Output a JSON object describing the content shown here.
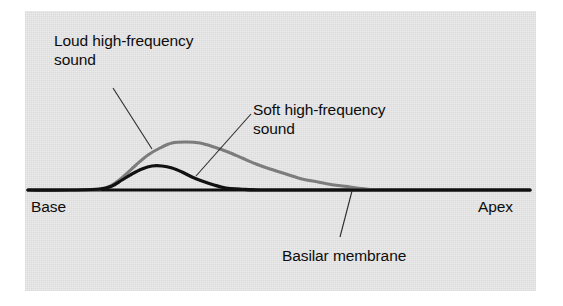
{
  "figure": {
    "kind": "scientific-diagram",
    "background_color": "#ffffff",
    "panel_color": "#e9e9e9"
  },
  "labels": {
    "loud": "Loud high-frequency\nsound",
    "soft": "Soft high-frequency\nsound",
    "basilar": "Basilar membrane",
    "base": "Base",
    "apex": "Apex"
  },
  "chart_data": {
    "type": "line",
    "title": "",
    "xlabel": "",
    "ylabel": "",
    "grid": false,
    "legend": "none",
    "axis_endpoints": {
      "left": "Base",
      "right": "Apex"
    },
    "xlim": [
      28,
      530
    ],
    "ylim": [
      190,
      138
    ],
    "series": [
      {
        "name": "Loud high-frequency sound",
        "color": "#7c7c7c",
        "width": 3.0,
        "peak": {
          "x": 176,
          "y": 142
        },
        "points": [
          [
            28,
            190
          ],
          [
            70,
            190
          ],
          [
            100,
            189
          ],
          [
            112,
            185
          ],
          [
            124,
            176
          ],
          [
            136,
            165
          ],
          [
            148,
            155
          ],
          [
            160,
            148
          ],
          [
            172,
            143
          ],
          [
            186,
            142
          ],
          [
            200,
            143
          ],
          [
            214,
            147
          ],
          [
            228,
            152
          ],
          [
            242,
            158
          ],
          [
            256,
            164
          ],
          [
            270,
            169
          ],
          [
            286,
            174
          ],
          [
            302,
            179
          ],
          [
            318,
            182
          ],
          [
            334,
            185
          ],
          [
            350,
            187
          ],
          [
            366,
            189
          ],
          [
            378,
            190
          ]
        ]
      },
      {
        "name": "Soft high-frequency sound",
        "color": "#111111",
        "width": 3.2,
        "peak": {
          "x": 156,
          "y": 166
        },
        "points": [
          [
            28,
            190
          ],
          [
            70,
            190
          ],
          [
            100,
            189
          ],
          [
            112,
            186
          ],
          [
            122,
            180
          ],
          [
            132,
            174
          ],
          [
            142,
            169
          ],
          [
            152,
            166
          ],
          [
            162,
            166
          ],
          [
            172,
            168
          ],
          [
            182,
            172
          ],
          [
            192,
            177
          ],
          [
            202,
            181
          ],
          [
            214,
            185
          ],
          [
            226,
            188
          ],
          [
            240,
            189
          ],
          [
            260,
            190
          ],
          [
            320,
            190
          ],
          [
            420,
            190
          ],
          [
            530,
            190
          ]
        ]
      }
    ],
    "baseline": {
      "name": "Basilar membrane",
      "color": "#111111",
      "y": 190,
      "x_start": 28,
      "x_end": 530
    },
    "leaders": [
      {
        "name": "loud-leader",
        "from": [
          113,
          88
        ],
        "to": [
          152,
          149
        ]
      },
      {
        "name": "soft-leader",
        "from": [
          251,
          114
        ],
        "to": [
          196,
          176
        ]
      },
      {
        "name": "basilar-leader",
        "from": [
          352,
          191
        ],
        "to": [
          340,
          237
        ]
      }
    ]
  }
}
